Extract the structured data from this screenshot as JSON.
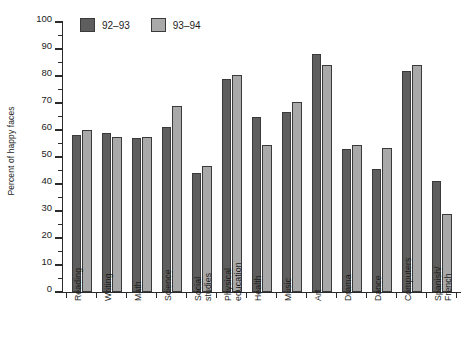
{
  "chart_data": {
    "type": "bar",
    "title": "",
    "xlabel": "",
    "ylabel": "Percent of happy faces",
    "ylim": [
      0,
      100
    ],
    "ytick_step": 10,
    "grid": false,
    "legend_position": "top-left",
    "categories": [
      "Reading",
      "Writing",
      "Math",
      "Science",
      "Social studies",
      "Physical education",
      "Health",
      "Music",
      "Art",
      "Drama",
      "Dance",
      "Computers",
      "Spanish/French"
    ],
    "category_label_lines": [
      [
        "Reading"
      ],
      [
        "Writing"
      ],
      [
        "Math"
      ],
      [
        "Science"
      ],
      [
        "Social",
        "studies"
      ],
      [
        "Physical",
        "education"
      ],
      [
        "Health"
      ],
      [
        "Music"
      ],
      [
        "Art"
      ],
      [
        "Drama"
      ],
      [
        "Dance"
      ],
      [
        "Computers"
      ],
      [
        "Spanish/",
        "French"
      ]
    ],
    "ytick_labels": [
      "0",
      "10",
      "20",
      "30",
      "40",
      "50",
      "60",
      "70",
      "80",
      "90",
      "100"
    ],
    "ytick_values": [
      0,
      10,
      20,
      30,
      40,
      50,
      60,
      70,
      80,
      90,
      100
    ],
    "series": [
      {
        "name": "92-93",
        "color": "#5e5e5e",
        "values": [
          58,
          59,
          57,
          61,
          44,
          79,
          65,
          66.5,
          88,
          53,
          45.5,
          82,
          41
        ]
      },
      {
        "name": "93-94",
        "color": "#a9a9a9",
        "values": [
          60,
          57.5,
          57.5,
          69,
          46.5,
          80.5,
          54.5,
          70.5,
          84,
          54.5,
          53.5,
          84,
          29
        ]
      }
    ]
  },
  "legend": {
    "entries": [
      {
        "label": "92–93",
        "color": "#5e5e5e"
      },
      {
        "label": "93–94",
        "color": "#a9a9a9"
      }
    ]
  },
  "axis": {
    "y_title": "Percent of happy faces"
  }
}
